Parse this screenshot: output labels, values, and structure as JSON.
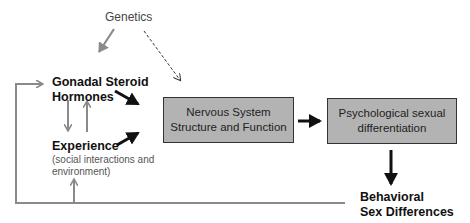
{
  "diagram": {
    "nodes": {
      "genetics": "Genetics",
      "gonadal_line1": "Gonadal Steroid",
      "gonadal_line2": "Hormones",
      "experience": "Experience",
      "experience_sub_line1": "(social interactions and",
      "experience_sub_line2": "environment)",
      "nervous_line1": "Nervous System",
      "nervous_line2": "Structure and Function",
      "psych_line1": "Psychological sexual",
      "psych_line2": "differentiation",
      "behavioral_line1": "Behavioral",
      "behavioral_line2": "Sex Differences"
    },
    "edges": [
      {
        "from": "Genetics",
        "to": "Gonadal Steroid Hormones",
        "style": "solid-gray"
      },
      {
        "from": "Genetics",
        "to": "Nervous System Structure and Function",
        "style": "dashed"
      },
      {
        "from": "Gonadal Steroid Hormones",
        "to": "Experience",
        "style": "solid-gray"
      },
      {
        "from": "Experience",
        "to": "Gonadal Steroid Hormones",
        "style": "solid-gray"
      },
      {
        "from": "Gonadal Steroid Hormones",
        "to": "Nervous System Structure and Function",
        "style": "bold-black"
      },
      {
        "from": "Experience",
        "to": "Nervous System Structure and Function",
        "style": "bold-black"
      },
      {
        "from": "Nervous System Structure and Function",
        "to": "Psychological sexual differentiation",
        "style": "bold-black"
      },
      {
        "from": "Psychological sexual differentiation",
        "to": "Behavioral Sex Differences",
        "style": "bold-black"
      },
      {
        "from": "Behavioral Sex Differences",
        "to": "Gonadal Steroid Hormones",
        "style": "feedback-gray"
      },
      {
        "from": "Behavioral Sex Differences",
        "to": "Experience",
        "style": "feedback-gray"
      }
    ],
    "colors": {
      "box_fill": "#b3b3b3",
      "gray_arrow": "#8a8a8a",
      "black_arrow": "#111111"
    }
  }
}
